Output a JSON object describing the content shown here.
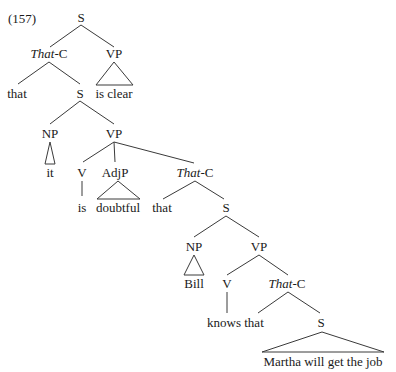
{
  "example_number": "(157)",
  "tree": {
    "root": {
      "label": "S"
    },
    "that_c_1": {
      "label_italic": "That",
      "label_suffix": "-C"
    },
    "vp_top": {
      "label": "VP",
      "terminal": "is clear"
    },
    "that_1": {
      "label": "that"
    },
    "s_2": {
      "label": "S"
    },
    "np_1": {
      "label": "NP",
      "terminal": "it"
    },
    "vp_2": {
      "label": "VP"
    },
    "v_1": {
      "label": "V",
      "terminal": "is"
    },
    "adjp": {
      "label": "AdjP",
      "terminal": "doubtful"
    },
    "that_c_2": {
      "label_italic": "That",
      "label_suffix": "-C"
    },
    "that_2": {
      "label": "that"
    },
    "s_3": {
      "label": "S"
    },
    "np_2": {
      "label": "NP",
      "terminal": "Bill"
    },
    "vp_3": {
      "label": "VP"
    },
    "v_2": {
      "label": "V",
      "terminal": "knows"
    },
    "that_c_3": {
      "label_italic": "That",
      "label_suffix": "-C"
    },
    "that_3": {
      "label": "that"
    },
    "s_4": {
      "label": "S",
      "terminal": "Martha will get the job"
    }
  }
}
